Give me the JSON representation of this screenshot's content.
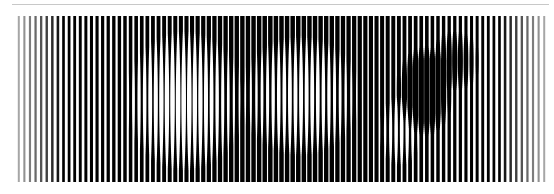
{
  "artwork": {
    "description": "Vertical line-modulation artwork (stripes with varying width forming a shaded image)",
    "background": "#ffffff",
    "rule_color": "#c8c8c8",
    "stripe_color": "#000000",
    "area": {
      "x0": 16,
      "x1": 547,
      "y0": 16,
      "y1": 181
    },
    "stripe_count": 95,
    "light_regions": [
      {
        "cx": 185,
        "cy": 100,
        "rx": 60,
        "ry": 70,
        "strength": 0.55
      },
      {
        "cx": 300,
        "cy": 95,
        "rx": 60,
        "ry": 60,
        "strength": 0.5
      },
      {
        "cx": 400,
        "cy": 130,
        "rx": 20,
        "ry": 35,
        "strength": 0.35
      }
    ],
    "dark_regions": [
      {
        "cx": 425,
        "cy": 90,
        "rx": 28,
        "ry": 45,
        "strength": 0.6
      },
      {
        "cx": 455,
        "cy": 60,
        "rx": 25,
        "ry": 30,
        "strength": 0.35
      }
    ]
  }
}
